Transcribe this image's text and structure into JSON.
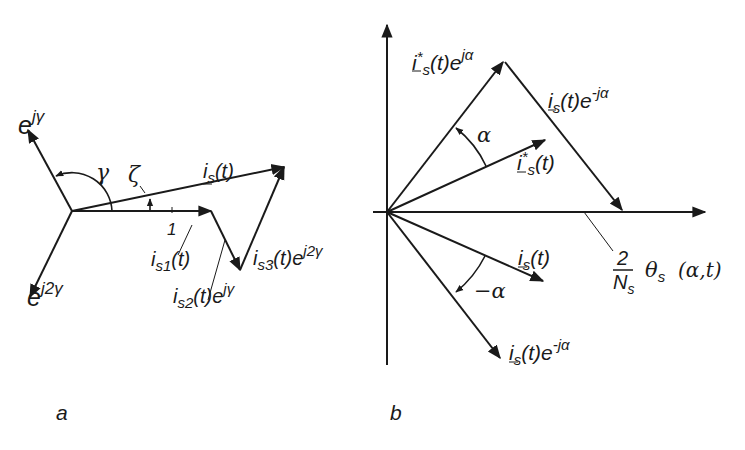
{
  "figure": {
    "panels": [
      {
        "id": "a",
        "caption": "a",
        "vectors": {
          "e_jgamma": {
            "base": "e",
            "sup": "jγ"
          },
          "e_j2gamma": {
            "base": "e",
            "sup": "j2γ"
          },
          "is_t": {
            "base": "i",
            "sub": "s",
            "arg": "(t)",
            "underlined": true
          },
          "is1_t": {
            "base": "i",
            "sub": "s1",
            "arg": "(t)"
          },
          "is2_t": {
            "base": "i",
            "sub": "s2",
            "arg": "(t)e",
            "sup": "jγ"
          },
          "is3_t": {
            "base": "i",
            "sub": "s3",
            "arg": "(t)e",
            "sup": "j2γ"
          }
        },
        "angles": {
          "gamma": "γ",
          "zeta": "ζ"
        },
        "unit_tick": "1"
      },
      {
        "id": "b",
        "caption": "b",
        "vectors": {
          "istar_e_jalpha": {
            "base": "i",
            "star": "*",
            "sub": "s",
            "arg": "(t)e",
            "sup": "jα",
            "underlined": true
          },
          "is_e_neg_jalpha_top": {
            "base": "i",
            "sub": "s",
            "arg": "(t)e",
            "sup": "-jα",
            "underlined": true
          },
          "istar_t": {
            "base": "i",
            "star": "*",
            "sub": "s",
            "arg": "(t)",
            "underlined": true
          },
          "is_t": {
            "base": "i",
            "sub": "s",
            "arg": "(t)",
            "underlined": true
          },
          "is_e_neg_jalpha_bottom": {
            "base": "i",
            "sub": "s",
            "arg": "(t)e",
            "sup": "-jα",
            "underlined": true
          }
        },
        "angles": {
          "alpha": "α",
          "neg_alpha": "−α"
        },
        "theta_label": {
          "num": "2",
          "den": "N",
          "den_sub": "s",
          "theta": "θ",
          "theta_sub": "s",
          "args": "(α,t)"
        }
      }
    ]
  }
}
